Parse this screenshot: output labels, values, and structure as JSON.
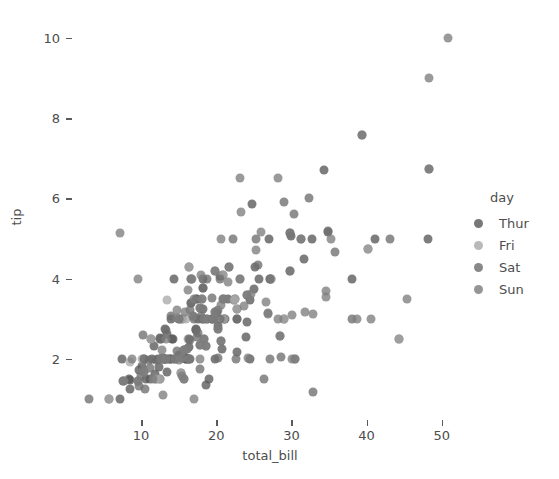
{
  "chart_data": {
    "type": "scatter",
    "title": "",
    "xlabel": "total_bill",
    "ylabel": "tip",
    "xlim": [
      0.8,
      53.5
    ],
    "ylim": [
      0.5,
      10.6
    ],
    "xticks": [
      10,
      20,
      30,
      40,
      50
    ],
    "yticks": [
      2,
      4,
      6,
      8,
      10
    ],
    "grid": false,
    "legend": {
      "title": "day",
      "position": "right",
      "entries": [
        {
          "label": "Thur",
          "color": "#595959"
        },
        {
          "label": "Fri",
          "color": "#a9a9a9"
        },
        {
          "label": "Sat",
          "color": "#6e6e6e"
        },
        {
          "label": "Sun",
          "color": "#7e7e7e"
        }
      ]
    },
    "series": [
      {
        "name": "Thur",
        "color": "#595959",
        "points": [
          [
            27.2,
            4.0
          ],
          [
            22.76,
            3.0
          ],
          [
            17.29,
            2.71
          ],
          [
            19.44,
            3.0
          ],
          [
            16.66,
            3.4
          ],
          [
            10.07,
            1.83
          ],
          [
            32.68,
            5.0
          ],
          [
            15.98,
            2.03
          ],
          [
            34.83,
            5.17
          ],
          [
            13.03,
            2.0
          ],
          [
            18.28,
            4.0
          ],
          [
            24.71,
            5.85
          ],
          [
            21.16,
            3.0
          ],
          [
            28.97,
            3.0
          ],
          [
            22.49,
            3.5
          ],
          [
            5.75,
            1.0
          ],
          [
            16.32,
            4.3
          ],
          [
            22.75,
            3.25
          ],
          [
            40.17,
            4.73
          ],
          [
            27.28,
            4.0
          ],
          [
            12.03,
            1.5
          ],
          [
            21.01,
            3.0
          ],
          [
            12.46,
            1.5
          ],
          [
            11.35,
            2.5
          ],
          [
            15.38,
            3.0
          ],
          [
            44.3,
            2.5
          ],
          [
            22.42,
            3.48
          ],
          [
            20.92,
            4.08
          ],
          [
            15.36,
            1.64
          ],
          [
            20.49,
            4.06
          ],
          [
            25.21,
            4.29
          ],
          [
            18.24,
            3.76
          ],
          [
            14.31,
            4.0
          ],
          [
            14.0,
            3.0
          ],
          [
            7.25,
            1.0
          ],
          [
            38.07,
            4.0
          ],
          [
            23.95,
            2.55
          ],
          [
            25.71,
            4.0
          ],
          [
            17.31,
            3.5
          ],
          [
            29.93,
            5.07
          ],
          [
            10.65,
            1.5
          ],
          [
            12.43,
            1.8
          ],
          [
            24.08,
            2.92
          ],
          [
            11.69,
            2.31
          ],
          [
            13.42,
            1.68
          ],
          [
            14.26,
            2.5
          ],
          [
            15.95,
            2.0
          ],
          [
            12.48,
            2.52
          ],
          [
            29.8,
            4.2
          ],
          [
            8.52,
            1.48
          ],
          [
            14.52,
            2.0
          ],
          [
            11.38,
            2.0
          ],
          [
            22.82,
            2.18
          ],
          [
            19.08,
            1.5
          ],
          [
            20.27,
            2.83
          ],
          [
            11.17,
            1.5
          ],
          [
            12.26,
            2.0
          ],
          [
            18.26,
            3.25
          ],
          [
            8.51,
            1.25
          ],
          [
            10.33,
            2.0
          ],
          [
            14.15,
            2.0
          ],
          [
            16.0,
            2.0
          ],
          [
            13.16,
            2.75
          ],
          [
            17.47,
            3.5
          ],
          [
            34.3,
            6.7
          ],
          [
            41.19,
            5.0
          ],
          [
            27.05,
            5.0
          ],
          [
            16.43,
            2.3
          ],
          [
            8.35,
            1.5
          ],
          [
            18.64,
            1.36
          ],
          [
            11.87,
            1.63
          ],
          [
            9.78,
            1.73
          ],
          [
            7.51,
            2.0
          ],
          [
            14.07,
            2.5
          ],
          [
            13.13,
            2.0
          ],
          [
            17.26,
            2.74
          ],
          [
            24.55,
            2.0
          ],
          [
            19.77,
            2.0
          ],
          [
            29.85,
            5.14
          ],
          [
            48.17,
            5.0
          ],
          [
            25.0,
            3.75
          ],
          [
            13.39,
            2.61
          ],
          [
            16.49,
            2.0
          ],
          [
            21.5,
            3.5
          ],
          [
            12.66,
            2.5
          ],
          [
            16.21,
            2.0
          ],
          [
            13.81,
            2.0
          ],
          [
            17.51,
            3.0
          ],
          [
            24.52,
            3.48
          ],
          [
            20.76,
            2.24
          ],
          [
            31.71,
            4.5
          ]
        ]
      },
      {
        "name": "Fri",
        "color": "#a9a9a9",
        "points": [
          [
            28.97,
            3.0
          ],
          [
            22.49,
            3.5
          ],
          [
            5.75,
            1.0
          ],
          [
            16.32,
            4.3
          ],
          [
            22.75,
            3.25
          ],
          [
            40.17,
            4.73
          ],
          [
            27.28,
            4.0
          ],
          [
            12.03,
            1.5
          ],
          [
            21.01,
            3.0
          ],
          [
            12.46,
            1.5
          ],
          [
            11.35,
            2.5
          ],
          [
            15.38,
            3.0
          ],
          [
            44.3,
            2.5
          ],
          [
            22.42,
            3.48
          ],
          [
            20.92,
            4.08
          ],
          [
            15.36,
            1.64
          ],
          [
            16.27,
            2.5
          ],
          [
            10.09,
            2.0
          ],
          [
            7.56,
            1.44
          ],
          [
            8.58,
            1.92
          ],
          [
            15.98,
            3.0
          ],
          [
            13.42,
            3.48
          ]
        ]
      },
      {
        "name": "Sat",
        "color": "#6e6e6e",
        "points": [
          [
            20.29,
            2.75
          ],
          [
            15.77,
            2.23
          ],
          [
            39.42,
            7.58
          ],
          [
            19.82,
            3.18
          ],
          [
            17.81,
            2.34
          ],
          [
            13.37,
            2.0
          ],
          [
            12.69,
            2.0
          ],
          [
            21.7,
            4.3
          ],
          [
            19.65,
            3.0
          ],
          [
            9.55,
            1.45
          ],
          [
            18.35,
            2.5
          ],
          [
            15.06,
            3.0
          ],
          [
            20.69,
            2.45
          ],
          [
            17.78,
            3.27
          ],
          [
            24.06,
            3.6
          ],
          [
            16.31,
            2.0
          ],
          [
            16.93,
            3.07
          ],
          [
            18.69,
            2.31
          ],
          [
            31.27,
            5.0
          ],
          [
            16.04,
            2.24
          ],
          [
            17.46,
            2.54
          ],
          [
            13.94,
            3.06
          ],
          [
            9.68,
            1.32
          ],
          [
            30.4,
            5.6
          ],
          [
            18.29,
            3.0
          ],
          [
            22.23,
            5.0
          ],
          [
            32.4,
            6.0
          ],
          [
            28.55,
            2.05
          ],
          [
            18.04,
            3.0
          ],
          [
            12.54,
            2.5
          ],
          [
            10.29,
            2.6
          ],
          [
            34.81,
            5.2
          ],
          [
            9.94,
            1.56
          ],
          [
            25.56,
            4.34
          ],
          [
            19.49,
            3.51
          ],
          [
            38.01,
            3.0
          ],
          [
            26.41,
            1.5
          ],
          [
            11.24,
            1.76
          ],
          [
            48.27,
            6.73
          ],
          [
            20.29,
            3.21
          ],
          [
            13.81,
            2.0
          ],
          [
            11.02,
            1.98
          ],
          [
            18.29,
            3.76
          ],
          [
            17.59,
            2.64
          ],
          [
            20.08,
            3.15
          ],
          [
            16.45,
            2.47
          ],
          [
            3.07,
            1.0
          ],
          [
            20.23,
            2.01
          ],
          [
            15.01,
            2.09
          ],
          [
            12.02,
            1.97
          ],
          [
            17.07,
            3.0
          ],
          [
            26.86,
            3.14
          ],
          [
            25.28,
            5.0
          ],
          [
            14.73,
            2.2
          ],
          [
            10.51,
            1.25
          ],
          [
            17.92,
            3.08
          ],
          [
            27.2,
            4.0
          ],
          [
            22.76,
            3.0
          ],
          [
            17.29,
            2.71
          ],
          [
            19.44,
            3.0
          ],
          [
            16.66,
            3.4
          ],
          [
            32.83,
            1.17
          ],
          [
            35.83,
            4.67
          ],
          [
            29.03,
            5.92
          ],
          [
            27.18,
            2.0
          ],
          [
            22.67,
            2.0
          ],
          [
            17.82,
            1.75
          ],
          [
            18.78,
            3.0
          ],
          [
            20.45,
            3.0
          ],
          [
            13.28,
            2.72
          ],
          [
            28.44,
            2.56
          ],
          [
            15.48,
            2.02
          ],
          [
            16.58,
            4.0
          ],
          [
            7.56,
            1.44
          ],
          [
            10.34,
            2.0
          ],
          [
            43.11,
            5.0
          ],
          [
            13.0,
            2.0
          ],
          [
            13.51,
            2.0
          ],
          [
            18.71,
            4.0
          ],
          [
            12.74,
            2.01
          ],
          [
            13.0,
            2.0
          ],
          [
            16.4,
            2.5
          ],
          [
            20.53,
            4.0
          ],
          [
            16.47,
            3.23
          ]
        ]
      },
      {
        "name": "Sun",
        "color": "#7e7e7e",
        "points": [
          [
            16.99,
            1.01
          ],
          [
            10.34,
            1.66
          ],
          [
            21.01,
            3.5
          ],
          [
            23.68,
            3.31
          ],
          [
            24.59,
            3.61
          ],
          [
            25.29,
            4.71
          ],
          [
            8.77,
            2.0
          ],
          [
            26.88,
            3.12
          ],
          [
            15.04,
            1.96
          ],
          [
            14.78,
            3.23
          ],
          [
            10.27,
            1.71
          ],
          [
            35.26,
            5.0
          ],
          [
            15.42,
            1.57
          ],
          [
            18.43,
            3.0
          ],
          [
            14.83,
            3.02
          ],
          [
            21.58,
            3.92
          ],
          [
            10.33,
            1.67
          ],
          [
            16.29,
            3.71
          ],
          [
            16.97,
            3.5
          ],
          [
            20.65,
            3.35
          ],
          [
            17.92,
            4.08
          ],
          [
            20.29,
            2.75
          ],
          [
            15.77,
            2.23
          ],
          [
            39.42,
            7.58
          ],
          [
            19.82,
            3.18
          ],
          [
            17.81,
            2.34
          ],
          [
            13.37,
            2.0
          ],
          [
            12.69,
            2.0
          ],
          [
            21.7,
            4.3
          ],
          [
            19.65,
            3.0
          ],
          [
            9.55,
            1.45
          ],
          [
            18.35,
            2.5
          ],
          [
            15.06,
            3.0
          ],
          [
            20.69,
            2.45
          ],
          [
            17.78,
            3.27
          ],
          [
            24.06,
            3.6
          ],
          [
            16.31,
            2.0
          ],
          [
            16.93,
            3.07
          ],
          [
            18.69,
            2.31
          ],
          [
            31.27,
            5.0
          ],
          [
            16.04,
            2.24
          ],
          [
            30.46,
            2.0
          ],
          [
            18.15,
            3.5
          ],
          [
            23.1,
            4.0
          ],
          [
            15.69,
            1.5
          ],
          [
            19.81,
            4.19
          ],
          [
            28.44,
            2.56
          ],
          [
            15.48,
            2.02
          ],
          [
            16.58,
            4.0
          ],
          [
            20.9,
            3.5
          ],
          [
            30.46,
            2.0
          ],
          [
            18.15,
            3.5
          ],
          [
            23.1,
            4.0
          ],
          [
            15.69,
            1.5
          ],
          [
            19.81,
            4.19
          ],
          [
            50.81,
            10.0
          ],
          [
            15.81,
            3.16
          ],
          [
            7.25,
            5.15
          ],
          [
            31.85,
            3.18
          ],
          [
            16.82,
            4.0
          ],
          [
            32.9,
            3.11
          ],
          [
            17.89,
            2.0
          ],
          [
            14.48,
            2.0
          ],
          [
            9.6,
            4.0
          ],
          [
            34.63,
            3.55
          ],
          [
            34.65,
            3.68
          ],
          [
            23.33,
            5.65
          ],
          [
            45.35,
            3.5
          ],
          [
            23.17,
            6.5
          ],
          [
            40.55,
            3.0
          ],
          [
            20.69,
            5.0
          ],
          [
            30.14,
            3.09
          ],
          [
            29.8,
            4.2
          ],
          [
            26.59,
            3.41
          ],
          [
            38.73,
            3.0
          ],
          [
            24.27,
            2.03
          ],
          [
            12.76,
            2.23
          ],
          [
            13.27,
            2.5
          ],
          [
            29.85,
            5.14
          ],
          [
            48.33,
            9.0
          ],
          [
            28.17,
            6.5
          ],
          [
            12.9,
            1.1
          ],
          [
            28.15,
            3.0
          ],
          [
            11.59,
            1.5
          ],
          [
            7.74,
            1.44
          ],
          [
            30.06,
            2.0
          ],
          [
            25.89,
            5.16
          ],
          [
            48.27,
            6.73
          ],
          [
            20.9,
            3.5
          ],
          [
            18.78,
            3.0
          ]
        ]
      }
    ]
  }
}
